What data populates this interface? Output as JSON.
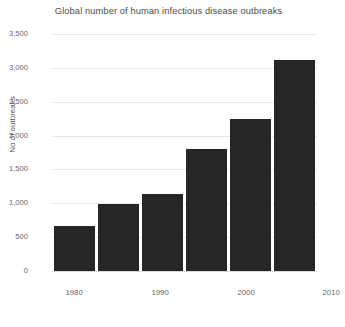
{
  "chart_data": {
    "type": "bar",
    "title": "Global number of human infectious disease outbreaks",
    "xlabel": "",
    "ylabel": "No of outbreaks",
    "categories": [
      "1980",
      "1985",
      "1990",
      "1995",
      "2000",
      "2005"
    ],
    "x_tick_labels": [
      "1980",
      "1990",
      "2000",
      "2010"
    ],
    "values": [
      665,
      990,
      1130,
      1800,
      2240,
      3110
    ],
    "ylim": [
      0,
      3500
    ],
    "y_tick_labels": [
      "0",
      "500",
      "1,000",
      "1,500",
      "2,000",
      "2,500",
      "3,000",
      "3,500"
    ],
    "y_tick_values": [
      0,
      500,
      1000,
      1500,
      2000,
      2500,
      3000,
      3500
    ],
    "grid": true,
    "legend": false,
    "bar_color": "#262626",
    "grid_color": "#e9e9e9",
    "background_color": "#ffffff",
    "text_color": "#5a5a5a"
  },
  "x_tick_positions": [
    {
      "label": "1980",
      "left": 0
    },
    {
      "label": "1990",
      "left": 86
    },
    {
      "label": "2000",
      "left": 172
    },
    {
      "label": "2010",
      "left": 257
    }
  ]
}
